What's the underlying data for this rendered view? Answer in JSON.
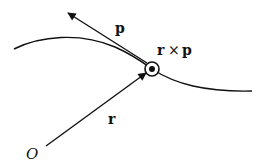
{
  "diagram": {
    "type": "angular-momentum-vector-diagram",
    "colors": {
      "stroke": "#111111",
      "background": "#ffffff"
    },
    "labels": {
      "momentum": "p",
      "cross_product_left": "r",
      "cross_product_op": "×",
      "cross_product_right": "p",
      "position": "r",
      "origin": "O"
    },
    "elements": {
      "trajectory": "curved path of particle",
      "particle_point": "circle with dot (vector out of page)",
      "momentum_vector": "tangent arrow p",
      "position_vector": "arrow r from origin O to particle"
    }
  }
}
